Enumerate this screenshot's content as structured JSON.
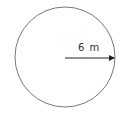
{
  "diagram": {
    "shape": "circle",
    "radius_label": "6 m",
    "stroke_color": "#777777",
    "arrow_color": "#222222"
  }
}
